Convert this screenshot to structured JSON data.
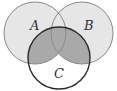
{
  "diagram": {
    "type": "venn",
    "sets": [
      {
        "name": "A",
        "label": "A",
        "cx": 35,
        "cy": 33,
        "r": 31,
        "label_x": 30,
        "label_y": 30
      },
      {
        "name": "B",
        "label": "B",
        "cx": 82,
        "cy": 33,
        "r": 31,
        "label_x": 84,
        "label_y": 30
      },
      {
        "name": "C",
        "label": "C",
        "cx": 59,
        "cy": 58,
        "r": 31,
        "label_x": 54,
        "label_y": 78
      }
    ],
    "shaded_region": "C ∩ (A ∪ B)",
    "colors": {
      "background": "#ffffff",
      "set_fill": "#e6e6e6",
      "shaded_fill": "#a9a9a9",
      "outline": "#8a8a8a",
      "c_outline": "#2a2a2a",
      "label": "#333333"
    }
  }
}
